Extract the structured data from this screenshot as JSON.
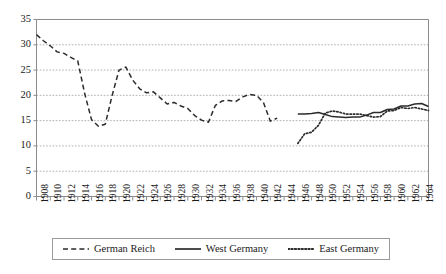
{
  "chart_data": {
    "type": "line",
    "title": "",
    "subtitle": "",
    "xlabel": "",
    "ylabel": "",
    "xlim": [
      1908,
      1965
    ],
    "ylim": [
      0,
      35
    ],
    "yticks": [
      0,
      5,
      10,
      15,
      20,
      25,
      30,
      35
    ],
    "xticks_labeled": [
      1908,
      1910,
      1912,
      1914,
      1916,
      1918,
      1920,
      1922,
      1924,
      1926,
      1928,
      1930,
      1932,
      1934,
      1936,
      1938,
      1940,
      1942,
      1944,
      1946,
      1948,
      1950,
      1952,
      1954,
      1956,
      1958,
      1960,
      1962,
      1964
    ],
    "xtick_interval_minor": 1,
    "grid": "horizontal-dotted",
    "legend_position": "bottom",
    "series": [
      {
        "name": "German Reich",
        "style": "dashed",
        "color": "#2b2b2b",
        "x": [
          1908,
          1909,
          1910,
          1911,
          1912,
          1913,
          1914,
          1915,
          1916,
          1917,
          1918,
          1919,
          1920,
          1921,
          1922,
          1923,
          1924,
          1925,
          1926,
          1927,
          1928,
          1929,
          1930,
          1931,
          1932,
          1933,
          1934,
          1935,
          1936,
          1937,
          1938,
          1939,
          1940,
          1941,
          1942,
          1943
        ],
        "values": [
          32.0,
          30.8,
          29.8,
          28.6,
          28.3,
          27.5,
          26.8,
          20.4,
          15.2,
          13.9,
          14.3,
          20.0,
          25.0,
          25.6,
          23.0,
          21.3,
          20.5,
          20.7,
          19.5,
          18.3,
          18.6,
          17.9,
          17.4,
          16.0,
          15.1,
          14.7,
          18.0,
          18.9,
          19.0,
          18.8,
          19.7,
          20.2,
          20.0,
          18.6,
          14.9,
          15.5
        ]
      },
      {
        "name": "West Germany",
        "style": "solid",
        "color": "#2b2b2b",
        "x": [
          1946,
          1947,
          1948,
          1949,
          1950,
          1951,
          1952,
          1953,
          1954,
          1955,
          1956,
          1957,
          1958,
          1959,
          1960,
          1961,
          1962,
          1963,
          1964,
          1965
        ],
        "values": [
          16.3,
          16.3,
          16.4,
          16.6,
          16.2,
          15.8,
          15.7,
          15.6,
          15.7,
          15.7,
          16.1,
          16.6,
          16.6,
          17.2,
          17.3,
          17.9,
          17.9,
          18.3,
          18.4,
          17.8
        ]
      },
      {
        "name": "East Germany",
        "style": "dotted",
        "color": "#2b2b2b",
        "x": [
          1946,
          1947,
          1948,
          1949,
          1950,
          1951,
          1952,
          1953,
          1954,
          1955,
          1956,
          1957,
          1958,
          1959,
          1960,
          1961,
          1962,
          1963,
          1964,
          1965
        ],
        "values": [
          10.5,
          12.4,
          12.7,
          14.1,
          16.5,
          16.9,
          16.7,
          16.3,
          16.3,
          16.3,
          16.0,
          15.7,
          15.8,
          16.9,
          17.0,
          17.6,
          17.4,
          17.6,
          17.3,
          17.0
        ]
      }
    ]
  },
  "axes": {
    "y_tick_labels": [
      "35",
      "30",
      "25",
      "20",
      "15",
      "10",
      "5",
      "0"
    ],
    "x_tick_labels": [
      "1908",
      "1910",
      "1912",
      "1914",
      "1916",
      "1918",
      "1920",
      "1922",
      "1924",
      "1926",
      "1928",
      "1930",
      "1932",
      "1934",
      "1936",
      "1938",
      "1940",
      "1942",
      "1944",
      "1946",
      "1948",
      "1950",
      "1952",
      "1954",
      "1956",
      "1958",
      "1960",
      "1962",
      "1964"
    ]
  },
  "legend": {
    "entries": [
      {
        "label": "German Reich",
        "style": "dashed"
      },
      {
        "label": "West Germany",
        "style": "solid"
      },
      {
        "label": "East Germany",
        "style": "dotted"
      }
    ]
  },
  "colors": {
    "line": "#2b2b2b",
    "grid": "#9a9a9a",
    "axis": "#8c8c8c",
    "text": "#1a1a1a",
    "background": "#ffffff"
  }
}
